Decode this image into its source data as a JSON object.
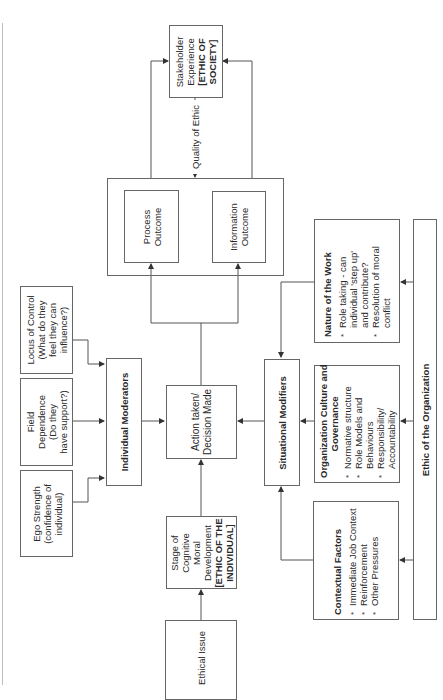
{
  "diagram": {
    "stakeholder": {
      "line1": "Stakeholder",
      "line2": "Experience",
      "bold1": "[ETHIC OF",
      "bold2": "SOCIETY]"
    },
    "quality_label": "Quality of Ethic",
    "process_outcome": {
      "line1": "Process",
      "line2": "Outcome"
    },
    "information_outcome": {
      "line1": "Information",
      "line2": "Outcome"
    },
    "locus_of_control": {
      "line1": "Locus of Control",
      "line2": "(What do they",
      "line3": "feel they can",
      "line4": "influence?)"
    },
    "field_dependence": {
      "line1": "Field",
      "line2": "Dependence",
      "line3": "(Do they",
      "line4": "have support?)"
    },
    "ego_strength": {
      "line1": "Ego Strength",
      "line2": "(confidence of",
      "line3": "individual)"
    },
    "individual_moderators": "Individual Moderators",
    "action_taken": {
      "line1": "Action taken/",
      "line2": "Decision Made"
    },
    "stage_cognitive": {
      "line1": "Stage of",
      "line2": "Cognitive",
      "line3": "Moral",
      "line4": "Development",
      "bold1": "[ETHIC OF THE",
      "bold2": "INDIVIDUAL]"
    },
    "ethical_issue": "Ethical Issue",
    "situational_modifiers": "Situational Modifiers",
    "nature_of_work": {
      "title": "Nature of the Work",
      "items": [
        "Role taking - can individual 'step up' and contribute?",
        "Resolution of moral conflict"
      ],
      "lines": [
        "Role taking - can",
        "individual 'step up'",
        "and contribute?",
        "Resolution of moral",
        "conflict"
      ]
    },
    "org_culture": {
      "title1": "Organization Culture and",
      "title2": "Governance",
      "lines": [
        "Normative structure",
        "Role Models and",
        "Behaviours",
        "Responsibility/",
        "Accountability"
      ]
    },
    "contextual_factors": {
      "title": "Contextual Factors",
      "lines": [
        "Immediate Job Context",
        "Reinforcement",
        "Other Pressures"
      ]
    },
    "ethic_of_org": "Ethic of the Organization"
  }
}
